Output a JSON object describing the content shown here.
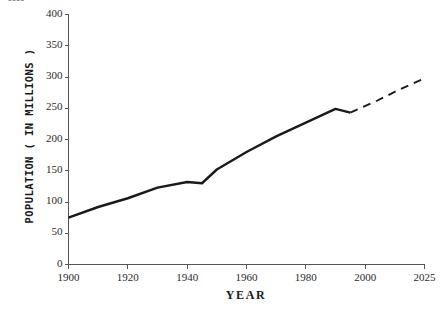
{
  "top_fragment": "----",
  "chart_data": {
    "type": "line",
    "title": "",
    "xlabel": "YEAR",
    "ylabel": "POPULATION ( IN MILLIONS )",
    "xlim": [
      1900,
      2025
    ],
    "ylim": [
      0,
      400
    ],
    "grid": false,
    "legend": "none",
    "x_ticks": [
      "1900",
      "1920",
      "1940",
      "1960",
      "1980",
      "2000",
      "2025"
    ],
    "x_tick_values": [
      1900,
      1920,
      1940,
      1960,
      1980,
      2000,
      2025
    ],
    "y_ticks": [
      "0",
      "50",
      "100",
      "150",
      "200",
      "250",
      "300",
      "350",
      "400"
    ],
    "y_tick_values": [
      0,
      50,
      100,
      150,
      200,
      250,
      300,
      350,
      400
    ],
    "line_color": "#1a1a1a",
    "axis_color": "#555555",
    "series": [
      {
        "name": "Observed population",
        "style": "solid",
        "x": [
          1900,
          1910,
          1920,
          1930,
          1940,
          1945,
          1950,
          1955,
          1960,
          1970,
          1980,
          1990,
          1995
        ],
        "values": [
          75,
          92,
          106,
          123,
          132,
          130,
          152,
          166,
          180,
          205,
          227,
          249,
          243
        ]
      },
      {
        "name": "Projected population",
        "style": "dashed",
        "x": [
          1995,
          2005,
          2015,
          2025
        ],
        "values": [
          243,
          262,
          281,
          298
        ]
      }
    ]
  }
}
